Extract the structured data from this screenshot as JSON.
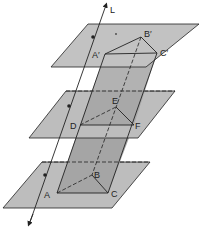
{
  "diagram": {
    "type": "geometry-3d",
    "line_label": "L",
    "planes": [
      {
        "name": "top-plane",
        "points": [
          [
            88,
            24
          ],
          [
            199,
            24
          ],
          [
            146,
            67
          ],
          [
            51,
            67
          ]
        ]
      },
      {
        "name": "middle-plane",
        "points": [
          [
            66,
            91
          ],
          [
            175,
            91
          ],
          [
            138,
            138
          ],
          [
            29,
            138
          ]
        ]
      },
      {
        "name": "bottom-plane",
        "points": [
          [
            42,
            162
          ],
          [
            150,
            162
          ],
          [
            112,
            208
          ],
          [
            3,
            208
          ]
        ]
      }
    ],
    "vertices": {
      "A_prime": {
        "label": "A′",
        "x": 105,
        "y": 54
      },
      "B_prime": {
        "label": "B′",
        "x": 141,
        "y": 37
      },
      "C_prime": {
        "label": "C′",
        "x": 157,
        "y": 53
      },
      "D": {
        "label": "D",
        "x": 80,
        "y": 125
      },
      "E": {
        "label": "E",
        "x": 116,
        "y": 107
      },
      "F": {
        "label": "F",
        "x": 134,
        "y": 125
      },
      "A": {
        "label": "A",
        "x": 57,
        "y": 193
      },
      "B": {
        "label": "B",
        "x": 92,
        "y": 175
      },
      "C": {
        "label": "C",
        "x": 108,
        "y": 193
      }
    },
    "colors": {
      "plane_fill": "#b8b8b8",
      "prism_fill": "#a9a9a9",
      "stroke": "#222222"
    }
  }
}
